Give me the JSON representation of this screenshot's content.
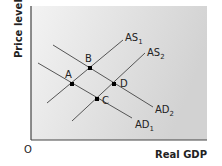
{
  "diagram": {
    "y_axis_label": "Price level",
    "x_axis_label": "Real GDP",
    "origin_label": "O",
    "colors": {
      "curve": "#555555",
      "point": "#000000",
      "axis": "#444444",
      "bg_light": "#f2f2f2",
      "bg_dark": "#d4d4d4"
    },
    "curves": [
      {
        "id": "AS1",
        "base": "AS",
        "sub": "1",
        "x1": 47,
        "y1": 103,
        "x2": 123,
        "y2": 40,
        "lx": 125,
        "ly": 41
      },
      {
        "id": "AS2",
        "base": "AS",
        "sub": "2",
        "x1": 72,
        "y1": 121,
        "x2": 145,
        "y2": 53,
        "lx": 147,
        "ly": 56
      },
      {
        "id": "AD1",
        "base": "AD",
        "sub": "1",
        "x1": 38,
        "y1": 63,
        "x2": 132,
        "y2": 118,
        "lx": 135,
        "ly": 128
      },
      {
        "id": "AD2",
        "base": "AD",
        "sub": "2",
        "x1": 53,
        "y1": 45,
        "x2": 153,
        "y2": 107,
        "lx": 155,
        "ly": 113
      }
    ],
    "points": [
      {
        "label": "A",
        "x": 72,
        "y": 84,
        "lx": 65,
        "ly": 78
      },
      {
        "label": "B",
        "x": 90,
        "y": 68,
        "lx": 85,
        "ly": 62
      },
      {
        "label": "C",
        "x": 97,
        "y": 99,
        "lx": 102,
        "ly": 104
      },
      {
        "label": "D",
        "x": 114,
        "y": 84,
        "lx": 120,
        "ly": 87
      }
    ]
  }
}
